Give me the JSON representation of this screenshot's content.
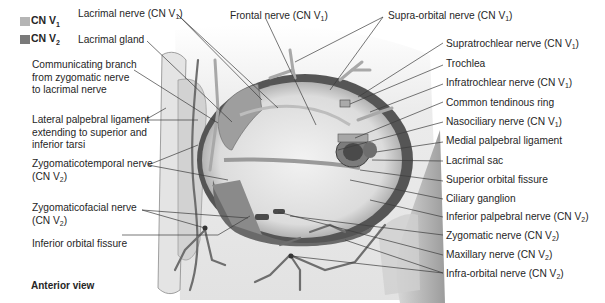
{
  "legend": {
    "items": [
      {
        "label": "CN V",
        "sub": "1",
        "color": "#b5b5b5"
      },
      {
        "label": "CN V",
        "sub": "2",
        "color": "#7a7a7a"
      }
    ]
  },
  "view_label": "Anterior view",
  "labels_left": [
    {
      "id": "lacrimal-nerve",
      "text": "Lacrimal nerve (CN V",
      "sub": "1",
      "suffix": ")"
    },
    {
      "id": "lacrimal-gland",
      "text": "Lacrimal gland"
    },
    {
      "id": "communicating-branch",
      "lines": [
        "Communicating branch",
        "from zygomatic nerve",
        "to lacrimal nerve"
      ]
    },
    {
      "id": "lateral-palpebral-ligament",
      "lines": [
        "Lateral palpebral ligament",
        "extending to superior and",
        "inferior tarsi"
      ]
    },
    {
      "id": "zygomaticotemporal-nerve",
      "lines": [
        "Zygomaticotemporal nerve",
        "(CN V"
      ],
      "sub": "2",
      "suffix": ")"
    },
    {
      "id": "zygomaticofacial-nerve",
      "lines": [
        "Zygomaticofacial nerve",
        "(CN V"
      ],
      "sub": "2",
      "suffix": ")"
    },
    {
      "id": "inferior-orbital-fissure",
      "text": "Inferior orbital fissure"
    }
  ],
  "labels_top": [
    {
      "id": "frontal-nerve",
      "text": "Frontal nerve (CN V",
      "sub": "1",
      "suffix": ")"
    },
    {
      "id": "supra-orbital-nerve",
      "text": "Supra-orbital nerve (CN V",
      "sub": "1",
      "suffix": ")"
    }
  ],
  "labels_right": [
    {
      "id": "supratrochlear-nerve",
      "text": "Supratrochlear nerve (CN V",
      "sub": "1",
      "suffix": ")"
    },
    {
      "id": "trochlea",
      "text": "Trochlea"
    },
    {
      "id": "infratrochlear-nerve",
      "text": "Infratrochlear nerve (CN V",
      "sub": "1",
      "suffix": ")"
    },
    {
      "id": "common-tendinous-ring",
      "text": "Common tendinous ring"
    },
    {
      "id": "nasociliary-nerve",
      "text": "Nasociliary nerve (CN V",
      "sub": "1",
      "suffix": ")"
    },
    {
      "id": "medial-palpebral-ligament",
      "text": "Medial palpebral ligament"
    },
    {
      "id": "lacrimal-sac",
      "text": "Lacrimal sac"
    },
    {
      "id": "superior-orbital-fissure",
      "text": "Superior orbital fissure"
    },
    {
      "id": "ciliary-ganglion",
      "text": "Ciliary ganglion"
    },
    {
      "id": "inferior-palpebral-nerve",
      "text": "Inferior palpebral nerve (CN V",
      "sub": "2",
      "suffix": ")"
    },
    {
      "id": "zygomatic-nerve",
      "text": "Zygomatic nerve (CN V",
      "sub": "2",
      "suffix": ")"
    },
    {
      "id": "maxillary-nerve",
      "text": "Maxillary nerve (CN V",
      "sub": "2",
      "suffix": ")"
    },
    {
      "id": "infra-orbital-nerve",
      "text": "Infra-orbital nerve (CN V",
      "sub": "2",
      "suffix": ")"
    }
  ],
  "colors": {
    "cn_v1": "#b5b5b5",
    "cn_v2": "#7a7a7a",
    "leader_line": "#444444",
    "nerve": "#6e6e6e",
    "bone_light": "#e6e6e6",
    "bone_mid": "#c8c8c8",
    "orbit_dark": "#5a5a5a"
  }
}
